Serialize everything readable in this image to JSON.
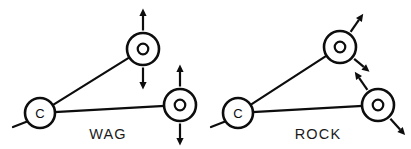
{
  "figure": {
    "background_color": "#ffffff",
    "stroke_color": "#0d0d0d",
    "width": 411,
    "height": 149
  },
  "panels": [
    {
      "id": "wag",
      "label": "WAG",
      "label_x": 108,
      "label_y": 139,
      "atoms": [
        {
          "id": "wag-c",
          "element": "C",
          "x": 40,
          "y": 113,
          "radius": 15,
          "style": "letter"
        },
        {
          "id": "wag-o1",
          "element": "O",
          "x": 143,
          "y": 49,
          "radius": 16,
          "style": "ring"
        },
        {
          "id": "wag-o2",
          "element": "O",
          "x": 180,
          "y": 105,
          "radius": 16,
          "style": "ring"
        }
      ],
      "bonds": [
        {
          "from": "wag-c",
          "to": "wag-o1"
        },
        {
          "from": "wag-c",
          "to": "wag-o2"
        }
      ],
      "stub": {
        "x1": 13,
        "y1": 127,
        "x2": 31,
        "y2": 120
      },
      "arrows": [
        {
          "atom": "wag-o1",
          "direction_deg": 270,
          "label": "up",
          "length": 22
        },
        {
          "atom": "wag-o1",
          "direction_deg": 90,
          "label": "down",
          "length": 22
        },
        {
          "atom": "wag-o2",
          "direction_deg": 270,
          "label": "up",
          "length": 22
        },
        {
          "atom": "wag-o2",
          "direction_deg": 90,
          "label": "down",
          "length": 22
        }
      ]
    },
    {
      "id": "rock",
      "label": "ROCK",
      "label_x": 318,
      "label_y": 139,
      "atoms": [
        {
          "id": "rock-c",
          "element": "C",
          "x": 238,
          "y": 113,
          "radius": 15,
          "style": "letter"
        },
        {
          "id": "rock-o1",
          "element": "O",
          "x": 340,
          "y": 47,
          "radius": 16,
          "style": "ring"
        },
        {
          "id": "rock-o2",
          "element": "O",
          "x": 378,
          "y": 105,
          "radius": 16,
          "style": "ring"
        }
      ],
      "bonds": [
        {
          "from": "rock-c",
          "to": "rock-o1"
        },
        {
          "from": "rock-c",
          "to": "rock-o2"
        }
      ],
      "stub": {
        "x1": 211,
        "y1": 127,
        "x2": 229,
        "y2": 120
      },
      "arrows": [
        {
          "atom": "rock-o1",
          "direction_deg": 305,
          "label": "up-right",
          "length": 22
        },
        {
          "atom": "rock-o1",
          "direction_deg": 40,
          "label": "down-right",
          "length": 20
        },
        {
          "atom": "rock-o2",
          "direction_deg": 235,
          "label": "up-left",
          "length": 22
        },
        {
          "atom": "rock-o2",
          "direction_deg": 48,
          "label": "down-right",
          "length": 22
        }
      ]
    }
  ]
}
